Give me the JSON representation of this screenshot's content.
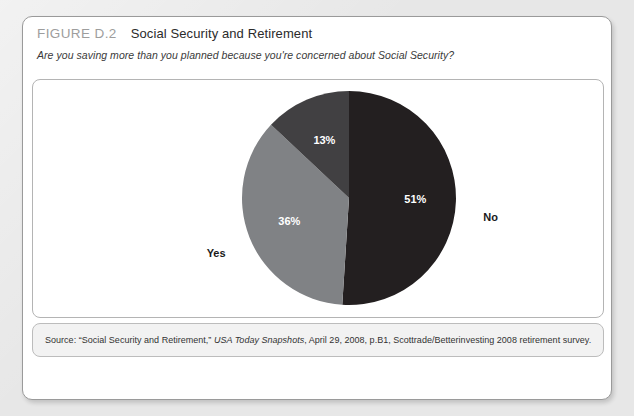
{
  "figure": {
    "number": "FIGURE D.2",
    "title": "Social Security and Retirement",
    "question": "Are you saving more than you planned because you're concerned about Social Security?",
    "source_prefix": "Source: “Social Security and Retirement,” ",
    "source_publication": "USA Today Snapshots",
    "source_suffix": ", April 29, 2008, p.B1, Scottrade/Betterinvesting 2008 retirement survey."
  },
  "chart_data": {
    "type": "pie",
    "title": "Social Security and Retirement",
    "subtitle": "Are you saving more than you planned because you're concerned about Social Security?",
    "categories": [
      "No",
      "Yes",
      "Not sure"
    ],
    "values": [
      51,
      36,
      13
    ],
    "value_labels": [
      "51%",
      "36%",
      "13%"
    ],
    "category_labels": [
      "No",
      "Yes",
      "Not sure"
    ],
    "colors": [
      "#231f20",
      "#808285",
      "#414042"
    ],
    "units": "percent",
    "legend": "none",
    "grid": false,
    "start_angle_deg": 0,
    "direction": "clockwise",
    "label_placement": "outside-callout-none"
  },
  "colors": {
    "page_background": "#e7e7e7",
    "card_background": "#ffffff",
    "source_background": "#f2f2f2",
    "figure_number": "#9d9d9d",
    "slice_no": "#231f20",
    "slice_yes": "#808285",
    "slice_not_sure": "#414042",
    "value_text": "#ffffff",
    "label_text": "#1a1a1a"
  }
}
